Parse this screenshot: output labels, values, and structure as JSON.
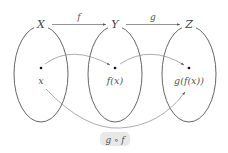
{
  "diagram": {
    "sets": [
      {
        "label": "X",
        "element": "x"
      },
      {
        "label": "Y",
        "element": "f(x)"
      },
      {
        "label": "Z",
        "element": "g(f(x))"
      }
    ],
    "maps": [
      {
        "label": "f",
        "from": "X",
        "to": "Y"
      },
      {
        "label": "g",
        "from": "Y",
        "to": "Z"
      }
    ],
    "composition": {
      "label": "g ∘ f",
      "from": "X",
      "to": "Z"
    },
    "colors": {
      "stroke": "#555555",
      "curve": "#888888",
      "text": "#555555",
      "label_bg": "#e8e8e8"
    }
  }
}
